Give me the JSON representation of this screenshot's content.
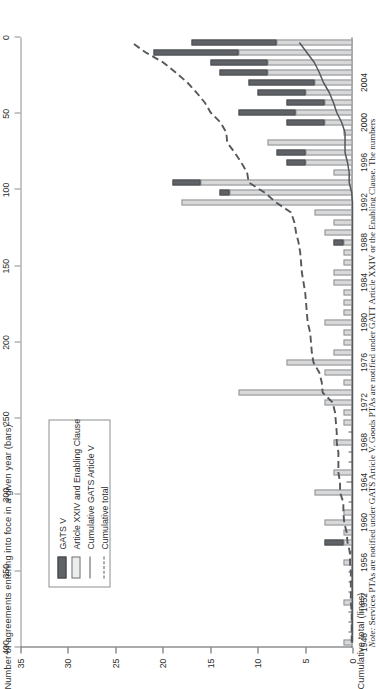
{
  "figure": {
    "bars_axis_title": "Number of agreements entering into foce in a given year (bars)",
    "cumulative_axis_title": "Cumulative total (lines)",
    "note_label": "Note:",
    "note_text": " Services PTAs are notified under GATS Article V. Goods PTAs are notified under GATT Article XXIV or the Enabling Clause. The numbers"
  },
  "legend": {
    "position": "upper-left",
    "items": [
      {
        "label": "GATS V",
        "key": "gats-swatch",
        "color": "#5f6266"
      },
      {
        "label": "Article XXIV and Enabling Clause",
        "key": "xxiv-swatch",
        "color": "#ededed"
      },
      {
        "label": "Cumulative GATS Article V",
        "key": "solid-line",
        "color": "#55585c"
      },
      {
        "label": "Cumulative total",
        "key": "dashed-line",
        "color": "#55585c"
      }
    ]
  },
  "chart_data": {
    "type": "bar",
    "title": "",
    "subtitle": "",
    "xlabel": "",
    "ylabel": "Number of agreements entering into foce in a given year (bars)",
    "y2label": "Cumulative total (lines)",
    "ylim": [
      0,
      35
    ],
    "y2lim": [
      0,
      400
    ],
    "grid": false,
    "legend_position": "upper-left",
    "bar_tick_labels": [
      "0",
      "5",
      "10",
      "15",
      "20",
      "25",
      "30",
      "35"
    ],
    "bar_ticks": [
      0,
      5,
      10,
      15,
      20,
      25,
      30,
      35
    ],
    "cumulative_tick_labels": [
      "0",
      "50",
      "100",
      "150",
      "200",
      "250",
      "300",
      "350",
      "400"
    ],
    "cumulative_ticks": [
      0,
      50,
      100,
      150,
      200,
      250,
      300,
      350,
      400
    ],
    "x_tick_labels": [
      "1948",
      "1952",
      "1956",
      "1960",
      "1964",
      "1968",
      "1972",
      "1976",
      "1980",
      "1984",
      "1988",
      "1992",
      "1996",
      "2000",
      "2004"
    ],
    "categories": [
      1948,
      1949,
      1950,
      1951,
      1952,
      1953,
      1954,
      1955,
      1956,
      1957,
      1958,
      1959,
      1960,
      1961,
      1962,
      1963,
      1964,
      1965,
      1966,
      1967,
      1968,
      1969,
      1970,
      1971,
      1972,
      1973,
      1974,
      1975,
      1976,
      1977,
      1978,
      1979,
      1980,
      1981,
      1982,
      1983,
      1984,
      1985,
      1986,
      1987,
      1988,
      1989,
      1990,
      1991,
      1992,
      1993,
      1994,
      1995,
      1996,
      1997,
      1998,
      1999,
      2000,
      2001,
      2002,
      2003,
      2004,
      2005,
      2006,
      2007,
      2008
    ],
    "series": [
      {
        "name": "Article XXIV and Enabling Clause",
        "stack": "agreements",
        "color": "#d8d8d8",
        "values": [
          1,
          0,
          0,
          0,
          1,
          0,
          0,
          0,
          1,
          0,
          1,
          1,
          3,
          1,
          0,
          4,
          0,
          2,
          0,
          0,
          2,
          0,
          1,
          1,
          3,
          12,
          1,
          3,
          7,
          2,
          1,
          1,
          3,
          1,
          1,
          1,
          2,
          2,
          1,
          1,
          1,
          3,
          2,
          4,
          18,
          13,
          16,
          2,
          5,
          5,
          9,
          1,
          3,
          6,
          3,
          5,
          4,
          9,
          9,
          12,
          8
        ]
      },
      {
        "name": "GATS V",
        "stack": "agreements",
        "color": "#5f6266",
        "values": [
          0,
          0,
          0,
          0,
          0,
          0,
          0,
          0,
          0,
          0,
          2,
          0,
          0,
          0,
          0,
          0,
          0,
          0,
          0,
          0,
          0,
          0,
          0,
          0,
          0,
          0,
          0,
          0,
          0,
          0,
          0,
          0,
          0,
          0,
          0,
          0,
          0,
          0,
          0,
          0,
          1,
          0,
          0,
          0,
          0,
          1,
          3,
          0,
          2,
          3,
          0,
          0,
          4,
          6,
          4,
          5,
          7,
          5,
          6,
          9,
          9
        ]
      },
      {
        "name": "Cumulative total",
        "type": "line",
        "axis": "cumulative",
        "style": "dashed",
        "color": "#55585c",
        "values": [
          1,
          1,
          1,
          1,
          2,
          2,
          2,
          2,
          3,
          3,
          6,
          7,
          10,
          11,
          11,
          15,
          15,
          17,
          17,
          17,
          19,
          19,
          20,
          21,
          24,
          36,
          37,
          40,
          47,
          49,
          50,
          51,
          54,
          55,
          56,
          57,
          59,
          61,
          62,
          63,
          65,
          68,
          70,
          74,
          92,
          106,
          125,
          127,
          134,
          142,
          151,
          152,
          159,
          171,
          178,
          188,
          199,
          213,
          228,
          249,
          266
        ]
      },
      {
        "name": "Cumulative GATS Article V",
        "type": "line",
        "axis": "cumulative",
        "style": "solid",
        "color": "#55585c",
        "values": [
          0,
          0,
          0,
          0,
          0,
          0,
          0,
          0,
          0,
          0,
          0,
          0,
          0,
          0,
          0,
          0,
          0,
          0,
          0,
          0,
          0,
          0,
          0,
          0,
          0,
          0,
          0,
          0,
          0,
          0,
          0,
          0,
          0,
          0,
          0,
          0,
          0,
          0,
          0,
          0,
          0,
          0,
          0,
          0,
          0,
          1,
          4,
          4,
          6,
          9,
          9,
          9,
          13,
          19,
          23,
          28,
          35,
          40,
          46,
          55,
          64
        ]
      }
    ]
  }
}
